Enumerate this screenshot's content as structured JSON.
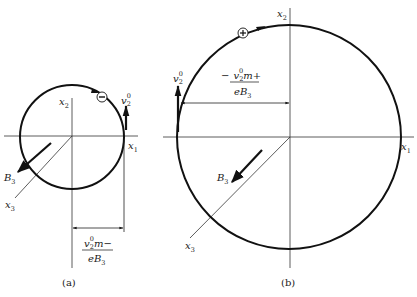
{
  "figure": {
    "panels": [
      {
        "id": "a",
        "caption": "(a)",
        "charge_symbol": "−",
        "axes": {
          "x1": "x",
          "x1_sub": "1",
          "x2": "x",
          "x2_sub": "2",
          "x3": "x",
          "x3_sub": "3"
        },
        "field": {
          "label": "B",
          "sub": "3"
        },
        "velocity": {
          "label": "v",
          "sub": "2",
          "sup": "0"
        },
        "radius_label": {
          "numerator": {
            "v": "v",
            "sub": "2",
            "sup": "0",
            "rest": "m−"
          },
          "denominator": "eB",
          "denominator_sub": "3"
        }
      },
      {
        "id": "b",
        "caption": "(b)",
        "charge_symbol": "+",
        "axes": {
          "x1": "x",
          "x1_sub": "1",
          "x2": "x",
          "x2_sub": "2",
          "x3": "x",
          "x3_sub": "3"
        },
        "field": {
          "label": "B",
          "sub": "3"
        },
        "velocity": {
          "label": "v",
          "sub": "2",
          "sup": "0"
        },
        "radius_label": {
          "prefix": "−",
          "numerator": {
            "v": "v",
            "sub": "2",
            "sup": "0",
            "rest": "m+"
          },
          "denominator": "eB",
          "denominator_sub": "3"
        }
      }
    ],
    "colors": {
      "ink": "#111111",
      "axis": "#333333",
      "background": "#ffffff"
    }
  }
}
